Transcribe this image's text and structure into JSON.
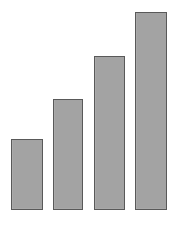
{
  "chart_data": {
    "type": "bar",
    "title": "",
    "subtitle": "",
    "xlabel": "",
    "ylabel": "",
    "categories": [
      "1",
      "2",
      "3",
      "4"
    ],
    "values": [
      25,
      39,
      55,
      70
    ],
    "ylim": [
      0,
      72
    ],
    "grid": false,
    "legend": null,
    "legend_position": "none",
    "axis_visible": false,
    "tick_labels_x": [],
    "tick_labels_y": [],
    "annotations": [],
    "series": [
      {
        "name": "",
        "values": [
          25,
          39,
          55,
          70
        ]
      }
    ],
    "style": {
      "background_color": "#ffffff",
      "bar_fill_color": "#a9a9a9",
      "bar_border_color": "#595959",
      "bar_border_width": 1
    },
    "geometry": {
      "baseline_y": 209,
      "bars": [
        {
          "x": 11,
          "y": 139,
          "width": 32,
          "height": 71
        },
        {
          "x": 53,
          "y": 99,
          "width": 30,
          "height": 111
        },
        {
          "x": 94,
          "y": 56,
          "width": 31,
          "height": 154
        },
        {
          "x": 135,
          "y": 12,
          "width": 32,
          "height": 198
        }
      ]
    }
  }
}
